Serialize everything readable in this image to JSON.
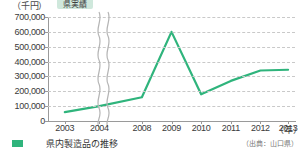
{
  "chart_data": {
    "type": "line",
    "title": "",
    "unit_label": "（千円）",
    "xlabel": "（年）",
    "ylabel": "",
    "categories": [
      "2003",
      "2004",
      "2008",
      "2009",
      "2010",
      "2011",
      "2012",
      "2013"
    ],
    "series": [
      {
        "name": "県実績",
        "color": "#2fb47c",
        "values": [
          60000,
          100000,
          160000,
          600000,
          180000,
          270000,
          340000,
          345000
        ]
      }
    ],
    "ylim": [
      0,
      700000
    ],
    "ytick_values": [
      0,
      100000,
      200000,
      300000,
      400000,
      500000,
      600000,
      700000
    ],
    "ytick_labels": [
      "0",
      "100,000",
      "200,000",
      "300,000",
      "400,000",
      "500,000",
      "600,000",
      "700,000"
    ],
    "grid": true,
    "grid_style": "dashed-horizontal",
    "legend_position": "top-left",
    "axis_break": {
      "present": true,
      "between": [
        "2004",
        "2008"
      ],
      "style": "wavy-double"
    }
  },
  "legend": {
    "label": "県実績",
    "background": "#cfe8dc"
  },
  "caption": {
    "marker_color": "#2fb47c",
    "number": "",
    "title": "県内製造品の推移",
    "source": "（出典：山口県）"
  },
  "colors": {
    "series": "#2fb47c",
    "grid": "#c9c9c9",
    "axis": "#9a9a9a",
    "text": "#3a3a3a"
  }
}
